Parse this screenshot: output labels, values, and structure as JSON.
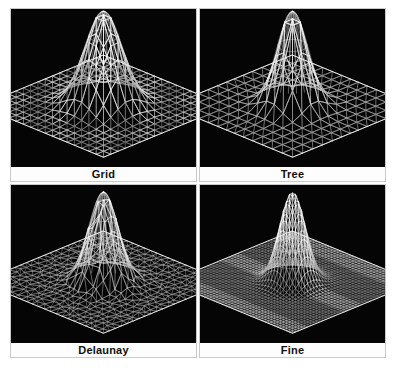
{
  "figure": {
    "background_color": "#ffffff",
    "panel_background_color": "#050505",
    "mesh_color": "#f2f2f2",
    "label_background_color": "#fdfdfd",
    "label_text_color": "#111111",
    "caption_text": "",
    "columns": 2,
    "rows": 2
  },
  "panels": [
    {
      "id": "grid",
      "label": "Grid",
      "mesh_type": "structured-quadtree-triangulated",
      "position": "top-left",
      "nx": 17,
      "ny": 17,
      "peak_height": 1.0,
      "peak_sigma": 0.11,
      "refine_mode": "blocky",
      "seed": 11
    },
    {
      "id": "tree",
      "label": "Tree",
      "mesh_type": "quadtree-balanced",
      "position": "top-right",
      "nx": 13,
      "ny": 13,
      "peak_height": 1.0,
      "peak_sigma": 0.09,
      "refine_mode": "center",
      "seed": 23
    },
    {
      "id": "delaunay",
      "label": "Delaunay",
      "mesh_type": "delaunay-unstructured",
      "position": "bottom-left",
      "nx": 21,
      "ny": 21,
      "peak_height": 0.95,
      "peak_sigma": 0.085,
      "refine_mode": "jittered",
      "seed": 37
    },
    {
      "id": "fine",
      "label": "Fine",
      "mesh_type": "uniform-fine",
      "position": "bottom-right",
      "nx": 41,
      "ny": 41,
      "peak_height": 0.95,
      "peak_sigma": 0.075,
      "refine_mode": "uniform",
      "seed": 53
    }
  ],
  "chart_data": {
    "type": "surface-mesh-3d",
    "title": "",
    "subplot_titles": [
      "Grid",
      "Tree",
      "Delaunay",
      "Fine"
    ],
    "surface_function": "gaussian-peak",
    "xlabel": "",
    "ylabel": "",
    "zlabel": "",
    "xlim": [
      -1,
      1
    ],
    "ylim": [
      -1,
      1
    ],
    "zlim": [
      0,
      1
    ],
    "grid": false,
    "legend": false,
    "series": [
      {
        "name": "Grid",
        "resolution": [
          17,
          17
        ],
        "peak": 1.0,
        "refinement": "adaptive-blocky"
      },
      {
        "name": "Tree",
        "resolution": [
          13,
          13
        ],
        "peak": 1.0,
        "refinement": "quadtree"
      },
      {
        "name": "Delaunay",
        "resolution": [
          21,
          21
        ],
        "peak": 0.95,
        "refinement": "unstructured"
      },
      {
        "name": "Fine",
        "resolution": [
          41,
          41
        ],
        "peak": 0.95,
        "refinement": "uniform"
      }
    ]
  }
}
